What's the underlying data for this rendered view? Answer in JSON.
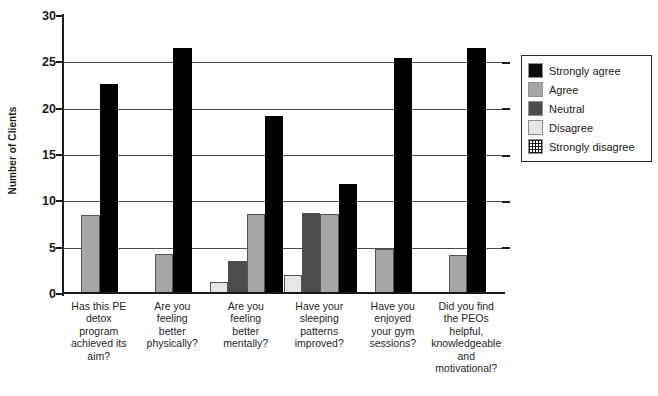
{
  "chart_data": {
    "type": "bar",
    "title": "",
    "xlabel": "",
    "ylabel": "Number of Clients",
    "ylim": [
      0,
      30
    ],
    "ytick_values": [
      0,
      5,
      10,
      15,
      20,
      25,
      30
    ],
    "ytick_labels": [
      "0",
      "5",
      "10",
      "15",
      "20",
      "25",
      "30"
    ],
    "grid": true,
    "grid_axis": "y",
    "legend_position": "right",
    "categories": [
      "Has this PE detox program achieved its aim?",
      "Are you feeling better physically?",
      "Are you feeling better mentally?",
      "Have your sleeping patterns improved?",
      "Have you enjoyed your gym sessions?",
      "Did you find the PEOs helpful, knowledgeable and motivational?"
    ],
    "category_lines": [
      [
        "Has this PE",
        "detox",
        "program",
        "achieved its",
        "aim?"
      ],
      [
        "Are you",
        "feeling",
        "better",
        "physically?"
      ],
      [
        "Are you",
        "feeling",
        "better",
        "mentally?"
      ],
      [
        "Have your",
        "sleeping",
        "patterns",
        "improved?"
      ],
      [
        "Have you",
        "enjoyed",
        "your gym",
        "sessions?"
      ],
      [
        "Did you find",
        "the PEOs",
        "helpful,",
        "knowledgeable",
        "and",
        "motivational?"
      ]
    ],
    "series": [
      {
        "name": "Strongly disagree",
        "color": "#ffffff",
        "pattern": "crosshatch",
        "values": [
          0,
          0,
          0,
          0,
          0,
          0
        ]
      },
      {
        "name": "Disagree",
        "color": "#e6e6e6",
        "pattern": "solid",
        "values": [
          0,
          0,
          1.3,
          2.1,
          0,
          0
        ]
      },
      {
        "name": "Neutral",
        "color": "#4d4d4d",
        "pattern": "solid",
        "values": [
          0,
          0,
          3.6,
          8.7,
          0,
          0
        ]
      },
      {
        "name": "Agree",
        "color": "#a6a6a6",
        "pattern": "solid",
        "values": [
          8.5,
          4.3,
          8.6,
          8.6,
          4.9,
          4.2
        ]
      },
      {
        "name": "Strongly agree",
        "color": "#000000",
        "pattern": "solid",
        "values": [
          22.7,
          26.5,
          19.2,
          11.9,
          25.5,
          26.6
        ]
      }
    ]
  },
  "legend": {
    "items": [
      {
        "label": "Strongly agree",
        "swatch": "black",
        "color": "#0d0d0d"
      },
      {
        "label": "Agree",
        "swatch": "mid-gray",
        "color": "#a6a6a6"
      },
      {
        "label": "Neutral",
        "swatch": "dark-gray",
        "color": "#4d4d4d"
      },
      {
        "label": "Disagree",
        "swatch": "light-gray",
        "color": "#e6e6e6"
      },
      {
        "label": "Strongly disagree",
        "swatch": "crosshatch",
        "color": "#ffffff"
      }
    ]
  }
}
